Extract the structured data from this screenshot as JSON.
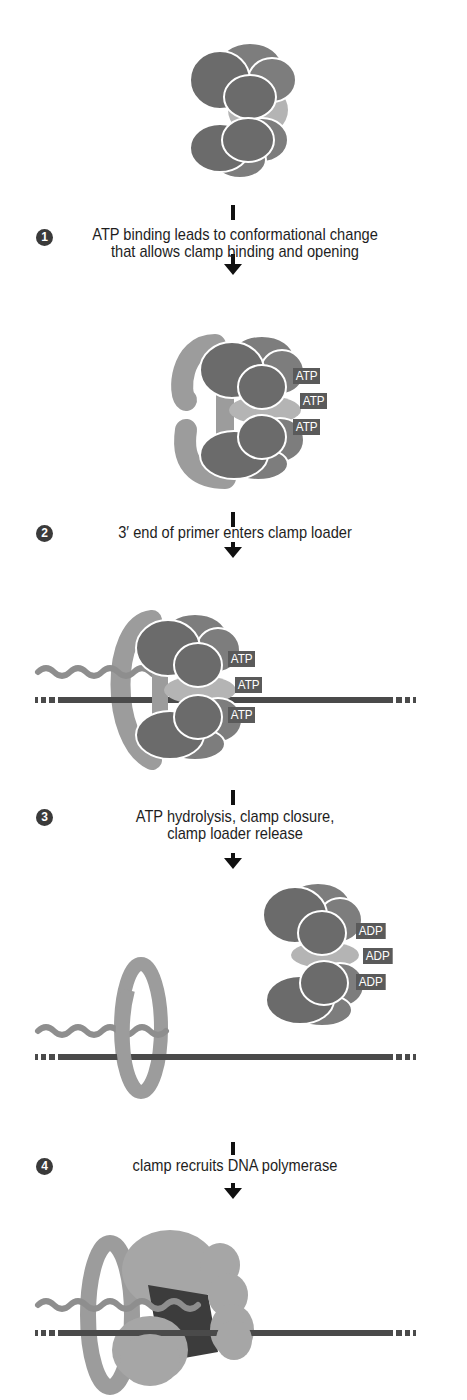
{
  "colors": {
    "clamp_loader_dark": "#6b6b6b",
    "clamp_loader_mid": "#7d7d7d",
    "clamp_light": "#9c9c9c",
    "clamp_loader_core": "#b4b4b4",
    "dna": "#4a4a4a",
    "primer": "#8e8e8e",
    "polymerase_core": "#3c3c3c",
    "polymerase_body": "#a6a6a6",
    "arrow": "#111111",
    "badge": "#3a3a3a",
    "tag_bg": "#5a5a5a"
  },
  "steps": [
    {
      "number": "1",
      "line1": "ATP binding leads to conformational change",
      "line2": "that allows clamp binding and opening"
    },
    {
      "number": "2",
      "line1": "3′ end of primer enters clamp loader",
      "line2": ""
    },
    {
      "number": "3",
      "line1": "ATP hydrolysis, clamp closure,",
      "line2": "clamp loader release"
    },
    {
      "number": "4",
      "line1": "clamp recruits DNA polymerase",
      "line2": ""
    }
  ],
  "panels": {
    "panel_b_tags": [
      "ATP",
      "ATP",
      "ATP"
    ],
    "panel_c_tags": [
      "ATP",
      "ATP",
      "ATP"
    ],
    "panel_d_tags": [
      "ADP",
      "ADP",
      "ADP"
    ]
  }
}
